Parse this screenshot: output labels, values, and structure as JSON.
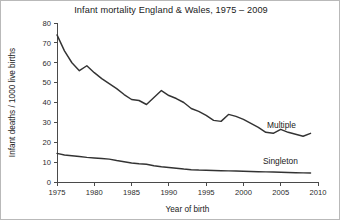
{
  "figure": {
    "title": "Infant mortality England & Wales, 1975 – 2009",
    "border_color": "#b9b9b9",
    "background": "#ffffff"
  },
  "axes": {
    "x_title": "Year of birth",
    "y_title": "Infant deaths / 1000 live births",
    "x_ticks": [
      "1975",
      "1980",
      "1985",
      "1990",
      "1995",
      "2000",
      "2005",
      "2010"
    ],
    "y_ticks": [
      "0",
      "10",
      "20",
      "30",
      "40",
      "50",
      "60",
      "70",
      "80"
    ]
  },
  "series_labels": {
    "multiple": "Multiple",
    "singleton": "Singleton"
  },
  "chart_data": {
    "type": "line",
    "title": "Infant mortality England & Wales, 1975 – 2009",
    "xlabel": "Year of birth",
    "ylabel": "Infant deaths / 1000 live births",
    "xlim": [
      1975,
      2010
    ],
    "ylim": [
      0,
      80
    ],
    "xticks": [
      1975,
      1980,
      1985,
      1990,
      1995,
      2000,
      2005,
      2010
    ],
    "yticks": [
      0,
      10,
      20,
      30,
      40,
      50,
      60,
      70,
      80
    ],
    "grid": false,
    "legend_position": "inline-right",
    "line_color": "#333333",
    "x": [
      1975,
      1976,
      1977,
      1978,
      1979,
      1980,
      1981,
      1982,
      1983,
      1984,
      1985,
      1986,
      1987,
      1988,
      1989,
      1990,
      1991,
      1992,
      1993,
      1994,
      1995,
      1996,
      1997,
      1998,
      1999,
      2000,
      2001,
      2002,
      2003,
      2004,
      2005,
      2006,
      2007,
      2008,
      2009
    ],
    "series": [
      {
        "name": "Multiple",
        "values": [
          74,
          66,
          60,
          56,
          58.5,
          55,
          52,
          49.5,
          47,
          44,
          41.5,
          41,
          39,
          42.5,
          46,
          43.5,
          42,
          40,
          37,
          35.5,
          33.5,
          31,
          30.5,
          34,
          33,
          31.5,
          29.5,
          27.5,
          25,
          24.5,
          26.5,
          25,
          24,
          23,
          24.5
        ]
      },
      {
        "name": "Singleton",
        "values": [
          14.4,
          13.6,
          13.2,
          12.8,
          12.4,
          12.1,
          11.8,
          11.5,
          10.8,
          10.2,
          9.6,
          9.2,
          8.9,
          8.2,
          7.7,
          7.3,
          6.9,
          6.5,
          6.2,
          6.0,
          5.9,
          5.8,
          5.7,
          5.6,
          5.5,
          5.4,
          5.3,
          5.2,
          5.1,
          5.0,
          4.9,
          4.8,
          4.7,
          4.6,
          4.5
        ]
      }
    ]
  }
}
